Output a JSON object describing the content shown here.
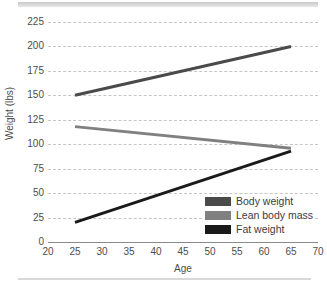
{
  "chart_data": {
    "type": "line",
    "title": "",
    "xlabel": "Age",
    "ylabel": "Weight (lbs)",
    "xlim": [
      20,
      70
    ],
    "ylim": [
      0,
      225
    ],
    "xticks": [
      20,
      25,
      30,
      35,
      40,
      45,
      50,
      55,
      60,
      65,
      70
    ],
    "yticks": [
      0,
      25,
      50,
      75,
      100,
      125,
      150,
      175,
      200,
      225
    ],
    "grid": "horizontal-dashed",
    "legend_position": "bottom-right",
    "x": [
      25,
      65
    ],
    "series": [
      {
        "name": "Body weight",
        "values": [
          150,
          200
        ],
        "color": "#4a4a4a"
      },
      {
        "name": "Lean body mass",
        "values": [
          118,
          96
        ],
        "color": "#808080"
      },
      {
        "name": "Fat weight",
        "values": [
          20,
          93
        ],
        "color": "#1a1a1a"
      }
    ]
  },
  "axes": {
    "y_title": "Weight (lbs)",
    "x_title": "Age",
    "y_tick_labels": [
      "225",
      "200",
      "175",
      "150",
      "125",
      "100",
      "75",
      "50",
      "25",
      "0"
    ],
    "x_tick_labels": [
      "20",
      "25",
      "30",
      "35",
      "40",
      "45",
      "50",
      "55",
      "60",
      "65",
      "70"
    ]
  },
  "legend": {
    "items": [
      {
        "label": "Body weight",
        "color": "#4a4a4a"
      },
      {
        "label": "Lean body mass",
        "color": "#808080"
      },
      {
        "label": "Fat weight",
        "color": "#1a1a1a"
      }
    ]
  },
  "colors": {
    "grid": "#c6c6c6",
    "axis": "#8a8a8a",
    "text": "#4d4d4d",
    "rule": "#d8d8d8"
  }
}
